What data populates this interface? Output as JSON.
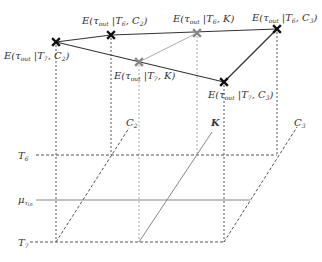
{
  "diagram": {
    "points": [
      {
        "id": "t7c2",
        "label": "E(τ_out |T_7, C_2)",
        "x": 56,
        "y": 42,
        "color": "#111111"
      },
      {
        "id": "t6c2",
        "label": "E(τ_out |T_6, C_2)",
        "x": 111,
        "y": 35,
        "color": "#111111"
      },
      {
        "id": "t6k",
        "label": "E(τ_out |T_6, K)",
        "x": 197,
        "y": 33,
        "color": "#888888"
      },
      {
        "id": "t6c3",
        "label": "E(τ_out |T_6, C_3)",
        "x": 277,
        "y": 29,
        "color": "#111111"
      },
      {
        "id": "t7k",
        "label": "E(τ_out |T_7, K)",
        "x": 139,
        "y": 62,
        "color": "#888888"
      },
      {
        "id": "t7c3",
        "label": "E(τ_out |T_7, C_3)",
        "x": 224,
        "y": 82,
        "color": "#111111"
      }
    ],
    "point_labels": {
      "t7c2": {
        "pre": "E(τ",
        "sub": "out",
        "mid": " |T",
        "sub2": "7",
        "post": ", C",
        "sub3": "2",
        "end": ")"
      },
      "t6c2": {
        "pre": "E(τ",
        "sub": "out",
        "mid": " |T",
        "sub2": "6",
        "post": ", C",
        "sub3": "2",
        "end": ")"
      },
      "t6k": {
        "pre": "E(τ",
        "sub": "out",
        "mid": " |T",
        "sub2": "6",
        "post": ", K",
        "sub3": "",
        "end": ")"
      },
      "t6c3": {
        "pre": "E(τ",
        "sub": "out",
        "mid": " |T",
        "sub2": "6",
        "post": ", C",
        "sub3": "3",
        "end": ")"
      },
      "t7k": {
        "pre": "E(τ",
        "sub": "out",
        "mid": " |T",
        "sub2": "7",
        "post": ", K",
        "sub3": "",
        "end": ")"
      },
      "t7c3": {
        "pre": "E(τ",
        "sub": "out",
        "mid": " |T",
        "sub2": "7",
        "post": ", C",
        "sub3": "3",
        "end": ")"
      }
    },
    "axis_labels": {
      "T6": {
        "main": "T",
        "sub": "6"
      },
      "mu": {
        "main": "μ",
        "sub": "τ",
        "subsub": "in"
      },
      "T7": {
        "main": "T",
        "sub": "7"
      },
      "C2": {
        "main": "C",
        "sub": "2"
      },
      "K": {
        "main": "K"
      },
      "C3": {
        "main": "C",
        "sub": "3"
      }
    },
    "colors": {
      "dark_line": "#333333",
      "gray_line": "#999999",
      "dashed": "#555555"
    }
  }
}
